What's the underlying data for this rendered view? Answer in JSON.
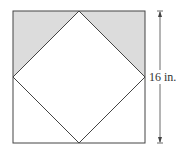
{
  "diagram": {
    "type": "square with inscribed diamond",
    "dimension_label": "16 in.",
    "shaded_region": "top two corner triangles",
    "colors": {
      "shade": "#dcdcdc",
      "stroke": "#444444"
    }
  }
}
